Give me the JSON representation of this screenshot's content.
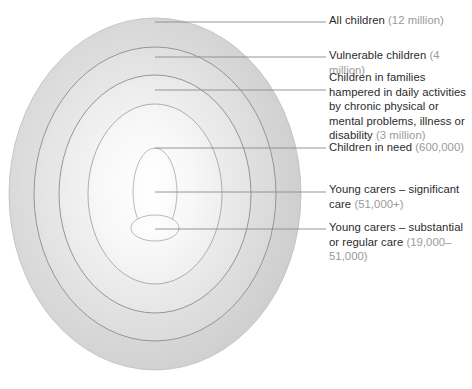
{
  "diagram": {
    "type": "concentric-ellipse-onion",
    "ring_stroke_color": "#8c8c8c",
    "leader_line_color": "#8a8a8a",
    "main_text_color": "#2b2b2b",
    "paren_text_color": "#9a9a9a",
    "background_color": "#ffffff",
    "rings": [
      {
        "id": "all-children",
        "label_main": "All children",
        "label_paren": "(12 million)",
        "value": "12 million",
        "fill": "#d2d2d2",
        "rx": 146,
        "ry": 176,
        "cx": 155,
        "cy": 194
      },
      {
        "id": "vulnerable-children",
        "label_main": "Vulnerable children",
        "label_paren": "(4 million)",
        "value": "4 million",
        "fill": "#dcdcdc",
        "rx": 121,
        "ry": 147,
        "cx": 155,
        "cy": 194
      },
      {
        "id": "children-in-families-hampered",
        "label_main": "Children in families hampered in daily activities by chronic physical or mental problems, illness or disability",
        "label_paren": "(3 million)",
        "value": "3 million",
        "fill": "#e6e6e6",
        "rx": 96,
        "ry": 119,
        "cx": 155,
        "cy": 194
      },
      {
        "id": "children-in-need",
        "label_main": "Children in need",
        "label_paren": "(600,000)",
        "value": "600,000",
        "fill": "#f0f0f0",
        "rx": 67,
        "ry": 90,
        "cx": 155,
        "cy": 194
      },
      {
        "id": "young-carers-significant-care",
        "label_main": "Young carers – significant care",
        "label_paren": "(51,000+)",
        "value": "51,000+",
        "fill": "#f8f8f8",
        "rx": 22,
        "ry": 44,
        "cx": 155,
        "cy": 192
      },
      {
        "id": "young-carers-substantial-or-regular-care",
        "label_main": "Young carers – substantial or regular care",
        "label_paren": "(19,000–51,000)",
        "value": "19,000–51,000",
        "fill": "#fbfbfb",
        "rx": 24,
        "ry": 13,
        "cx": 155,
        "cy": 228
      }
    ]
  }
}
